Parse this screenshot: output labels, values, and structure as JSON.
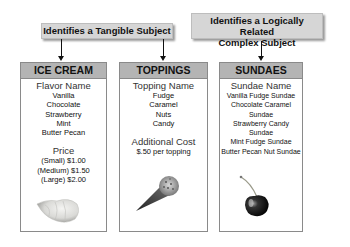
{
  "labels": {
    "tangible": "Identifies a Tangible Subject",
    "complex_line1": "Identifies a Logically Related",
    "complex_line2": "Complex Subject"
  },
  "cards": [
    {
      "title": "ICE CREAM",
      "section1_title": "Flavor Name",
      "section1_items": [
        "Vanilla",
        "Chocolate",
        "Strawberry",
        "Mint",
        "Butter Pecan"
      ],
      "section2_title": "Price",
      "section2_items": [
        "(Small) $1.00",
        "(Medium) $1.50",
        "(Large) $2.00"
      ],
      "image": "ice-cream-scoop"
    },
    {
      "title": "TOPPINGS",
      "section1_title": "Topping Name",
      "section1_items": [
        "Fudge",
        "Caramel",
        "Nuts",
        "Candy"
      ],
      "section2_title": "Additional Cost",
      "section2_items": [
        "$.50 per topping"
      ],
      "image": "ice-cream-cone"
    },
    {
      "title": "SUNDAES",
      "section1_title": "Sundae Name",
      "section1_items": [
        "Vanilla Fudge Sundae",
        "Chocolate Caramel Sundae",
        "Strawberry Candy Sundae",
        "Mint Fudge Sundae",
        "Butter Pecan Nut Sundae"
      ],
      "image": "cherry"
    }
  ]
}
